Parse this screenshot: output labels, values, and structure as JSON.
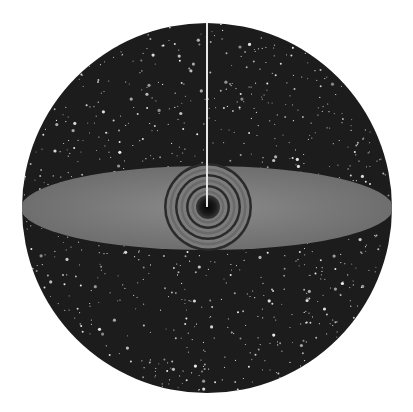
{
  "artwork": {
    "description": "Circular starfield with a grey ellipse band across the middle, concentric ring vortex at center, and a thin white vertical line descending from the top to the center",
    "background": "#ffffff",
    "sphere": {
      "cx": 207,
      "cy": 208,
      "r": 185,
      "color": "#1c1c1c"
    },
    "band": {
      "cx": 207,
      "cy": 208,
      "rx": 186,
      "ry": 42,
      "color": "#7a7a7a"
    },
    "vortex": {
      "cx": 208,
      "cy": 207,
      "rings": 7,
      "outer_r": 44,
      "ring_color": "#2a2a2a",
      "core_color": "#0e0e0e"
    },
    "line": {
      "x": 207,
      "y1": 23,
      "y2": 207,
      "color": "#e8e8e8",
      "width": 2
    },
    "star_color": "#f2f2f2",
    "star_count": 900
  }
}
